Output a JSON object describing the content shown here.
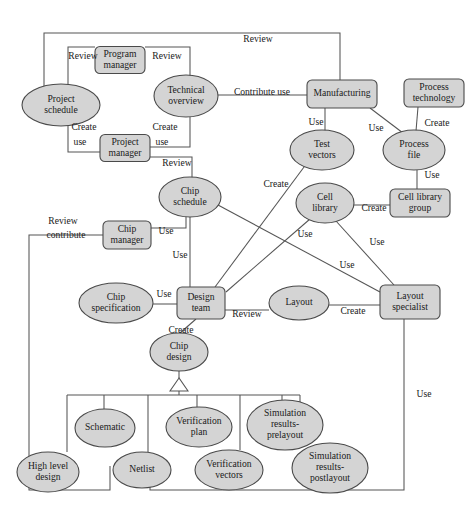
{
  "diagram": {
    "colors": {
      "node_fill": "#d4d4d4",
      "node_stroke": "#4a4a4a",
      "edge_stroke": "#555555",
      "background": "#ffffff",
      "text": "#1a1a1a"
    },
    "nodes": [
      {
        "id": "project-schedule",
        "label": "Project schedule",
        "lines": [
          "Project",
          "schedule"
        ],
        "shape": "ellipse",
        "cx": 61,
        "cy": 105,
        "rx": 39,
        "ry": 21
      },
      {
        "id": "program-manager",
        "label": "Program manager",
        "lines": [
          "Program",
          "manager"
        ],
        "shape": "rect",
        "cx": 120,
        "cy": 60,
        "w": 50,
        "h": 27
      },
      {
        "id": "technical-overview",
        "label": "Technical overview",
        "lines": [
          "Technical",
          "overview"
        ],
        "shape": "ellipse",
        "cx": 186,
        "cy": 96,
        "rx": 32,
        "ry": 21
      },
      {
        "id": "project-manager",
        "label": "Project manager",
        "lines": [
          "Project",
          "manager"
        ],
        "shape": "rect",
        "cx": 125,
        "cy": 148,
        "w": 50,
        "h": 27
      },
      {
        "id": "manufacturing",
        "label": "Manufacturing",
        "lines": [
          "Manufacturing"
        ],
        "shape": "rect",
        "cx": 342,
        "cy": 94,
        "w": 70,
        "h": 28
      },
      {
        "id": "process-technology",
        "label": "Process technology",
        "lines": [
          "Process",
          "technology"
        ],
        "shape": "rect",
        "cx": 434,
        "cy": 93,
        "w": 60,
        "h": 28
      },
      {
        "id": "test-vectors",
        "label": "Test vectors",
        "lines": [
          "Test",
          "vectors"
        ],
        "shape": "ellipse",
        "cx": 322,
        "cy": 150,
        "rx": 32,
        "ry": 20
      },
      {
        "id": "process-file",
        "label": "Process file",
        "lines": [
          "Process",
          "file"
        ],
        "shape": "ellipse",
        "cx": 414,
        "cy": 150,
        "rx": 31,
        "ry": 20
      },
      {
        "id": "chip-schedule",
        "label": "Chip schedule",
        "lines": [
          "Chip",
          "schedule"
        ],
        "shape": "ellipse",
        "cx": 190,
        "cy": 197,
        "rx": 31,
        "ry": 20
      },
      {
        "id": "cell-library",
        "label": "Cell library",
        "lines": [
          "Cell",
          "library"
        ],
        "shape": "ellipse",
        "cx": 325,
        "cy": 203,
        "rx": 29,
        "ry": 20
      },
      {
        "id": "cell-library-group",
        "label": "Cell library group",
        "lines": [
          "Cell library",
          "group"
        ],
        "shape": "rect",
        "cx": 420,
        "cy": 203,
        "w": 60,
        "h": 28
      },
      {
        "id": "chip-manager",
        "label": "Chip manager",
        "lines": [
          "Chip",
          "manager"
        ],
        "shape": "rect",
        "cx": 127,
        "cy": 235,
        "w": 48,
        "h": 28
      },
      {
        "id": "chip-specification",
        "label": "Chip specification",
        "lines": [
          "Chip",
          "specification"
        ],
        "shape": "ellipse",
        "cx": 116,
        "cy": 303,
        "rx": 37,
        "ry": 20
      },
      {
        "id": "design-team",
        "label": "Design team",
        "lines": [
          "Design",
          "team"
        ],
        "shape": "rect",
        "cx": 201,
        "cy": 303,
        "w": 48,
        "h": 32
      },
      {
        "id": "layout",
        "label": "Layout",
        "lines": [
          "Layout"
        ],
        "shape": "ellipse",
        "cx": 299,
        "cy": 303,
        "rx": 30,
        "ry": 17
      },
      {
        "id": "layout-specialist",
        "label": "Layout specialist",
        "lines": [
          "Layout",
          "specialist"
        ],
        "shape": "rect",
        "cx": 410,
        "cy": 302,
        "w": 60,
        "h": 34
      },
      {
        "id": "chip-design",
        "label": "Chip design",
        "lines": [
          "Chip",
          "design"
        ],
        "shape": "ellipse",
        "cx": 179,
        "cy": 352,
        "rx": 29,
        "ry": 19
      },
      {
        "id": "schematic",
        "label": "Schematic",
        "lines": [
          "Schematic"
        ],
        "shape": "ellipse",
        "cx": 105,
        "cy": 428,
        "rx": 30,
        "ry": 19
      },
      {
        "id": "high-level-design",
        "label": "High level design",
        "lines": [
          "High level",
          "design"
        ],
        "shape": "ellipse",
        "cx": 48,
        "cy": 472,
        "rx": 31,
        "ry": 20
      },
      {
        "id": "netlist",
        "label": "Netlist",
        "lines": [
          "Netlist"
        ],
        "shape": "ellipse",
        "cx": 142,
        "cy": 470,
        "rx": 29,
        "ry": 18
      },
      {
        "id": "verification-plan",
        "label": "Verification plan",
        "lines": [
          "Verification",
          "plan"
        ],
        "shape": "ellipse",
        "cx": 199,
        "cy": 427,
        "rx": 33,
        "ry": 20
      },
      {
        "id": "verification-vectors",
        "label": "Verification vectors",
        "lines": [
          "Verification",
          "vectors"
        ],
        "shape": "ellipse",
        "cx": 229,
        "cy": 470,
        "rx": 34,
        "ry": 20
      },
      {
        "id": "simulation-results-prelayout",
        "label": "Simulation results-prelayout",
        "lines": [
          "Simulation",
          "results-",
          "prelayout"
        ],
        "shape": "ellipse",
        "cx": 285,
        "cy": 425,
        "rx": 38,
        "ry": 25
      },
      {
        "id": "simulation-results-postlayout",
        "label": "Simulation results-postlayout",
        "lines": [
          "Simulation",
          "results-",
          "postlayout"
        ],
        "shape": "ellipse",
        "cx": 330,
        "cy": 468,
        "rx": 38,
        "ry": 25
      }
    ],
    "relationships": [
      {
        "from": "project-schedule",
        "to": "manufacturing",
        "label": "Review"
      },
      {
        "from": "project-schedule",
        "to": "program-manager",
        "label": "Review"
      },
      {
        "from": "program-manager",
        "to": "technical-overview",
        "label": "Review"
      },
      {
        "from": "technical-overview",
        "to": "manufacturing",
        "label": "Contribute use"
      },
      {
        "from": "project-manager",
        "to": "project-schedule",
        "label": "Create use"
      },
      {
        "from": "project-manager",
        "to": "technical-overview",
        "label": "Create use"
      },
      {
        "from": "project-manager",
        "to": "chip-schedule",
        "label": "Review"
      },
      {
        "from": "manufacturing",
        "to": "test-vectors",
        "label": "Use"
      },
      {
        "from": "manufacturing",
        "to": "process-file",
        "label": "Use"
      },
      {
        "from": "process-technology",
        "to": "process-file",
        "label": "Create"
      },
      {
        "from": "process-file",
        "to": "cell-library-group",
        "label": "Use"
      },
      {
        "from": "cell-library-group",
        "to": "cell-library",
        "label": "Create"
      },
      {
        "from": "design-team",
        "to": "test-vectors",
        "label": "Create"
      },
      {
        "from": "chip-manager",
        "to": "chip-schedule",
        "label": "Use"
      },
      {
        "from": "chip-manager",
        "to": "chip-design",
        "label": "Review contribute"
      },
      {
        "from": "chip-schedule",
        "to": "design-team",
        "label": "Use"
      },
      {
        "from": "chip-schedule",
        "to": "layout-specialist",
        "label": "Use"
      },
      {
        "from": "cell-library",
        "to": "design-team",
        "label": "Use"
      },
      {
        "from": "cell-library",
        "to": "layout-specialist",
        "label": "Use"
      },
      {
        "from": "chip-specification",
        "to": "design-team",
        "label": "Use"
      },
      {
        "from": "design-team",
        "to": "layout",
        "label": "Review"
      },
      {
        "from": "layout-specialist",
        "to": "layout",
        "label": "Create"
      },
      {
        "from": "design-team",
        "to": "chip-design",
        "label": "Create"
      },
      {
        "from": "layout-specialist",
        "to": "chip-design",
        "label": "Use"
      }
    ],
    "generalization": {
      "parent": "chip-design",
      "children": [
        "schematic",
        "high-level-design",
        "netlist",
        "verification-plan",
        "verification-vectors",
        "simulation-results-prelayout",
        "simulation-results-postlayout"
      ]
    },
    "edge_labels": [
      {
        "id": "lbl-review-top",
        "text": "Review",
        "x": 258,
        "y": 40
      },
      {
        "id": "lbl-review-ps-pm",
        "text": "Review",
        "x": 83,
        "y": 57
      },
      {
        "id": "lbl-review-pm-to",
        "text": "Review",
        "x": 167,
        "y": 57
      },
      {
        "id": "lbl-contribute-use",
        "text": "Contribute use",
        "x": 262,
        "y": 93
      },
      {
        "id": "lbl-create-l1",
        "text": "Create",
        "x": 84,
        "y": 128
      },
      {
        "id": "lbl-use-l1",
        "text": "use",
        "x": 80,
        "y": 143
      },
      {
        "id": "lbl-create-l2",
        "text": "Create",
        "x": 165,
        "y": 128
      },
      {
        "id": "lbl-use-l2",
        "text": "use",
        "x": 162,
        "y": 143
      },
      {
        "id": "lbl-review-pm-cs",
        "text": "Review",
        "x": 177,
        "y": 164
      },
      {
        "id": "lbl-use-mfg-tv",
        "text": "Use",
        "x": 316,
        "y": 123
      },
      {
        "id": "lbl-use-mfg-pf",
        "text": "Use",
        "x": 376,
        "y": 129
      },
      {
        "id": "lbl-create-pt-pf",
        "text": "Create",
        "x": 437,
        "y": 124
      },
      {
        "id": "lbl-use-pf-clg",
        "text": "Use",
        "x": 432,
        "y": 176
      },
      {
        "id": "lbl-create-cl-clg",
        "text": "Create",
        "x": 374,
        "y": 209
      },
      {
        "id": "lbl-create-dt-tv",
        "text": "Create",
        "x": 276,
        "y": 185
      },
      {
        "id": "lbl-review",
        "text": "Review",
        "x": 63,
        "y": 222
      },
      {
        "id": "lbl-contribute",
        "text": "contribute",
        "x": 66,
        "y": 236
      },
      {
        "id": "lbl-use-cm-cs",
        "text": "Use",
        "x": 166,
        "y": 232
      },
      {
        "id": "lbl-use-cs-dt",
        "text": "Use",
        "x": 180,
        "y": 256
      },
      {
        "id": "lbl-use-cl-dt",
        "text": "Use",
        "x": 305,
        "y": 235
      },
      {
        "id": "lbl-use-cl-ls",
        "text": "Use",
        "x": 377,
        "y": 243
      },
      {
        "id": "lbl-use-csch-ls",
        "text": "Use",
        "x": 347,
        "y": 266
      },
      {
        "id": "lbl-use-spec-dt",
        "text": "Use",
        "x": 164,
        "y": 295
      },
      {
        "id": "lbl-review-dt-lay",
        "text": "Review",
        "x": 247,
        "y": 315
      },
      {
        "id": "lbl-create-ls-lay",
        "text": "Create",
        "x": 353,
        "y": 312
      },
      {
        "id": "lbl-create-dt-cd",
        "text": "Create",
        "x": 181,
        "y": 331
      },
      {
        "id": "lbl-use-ls-cd",
        "text": "Use",
        "x": 424,
        "y": 395
      }
    ]
  }
}
